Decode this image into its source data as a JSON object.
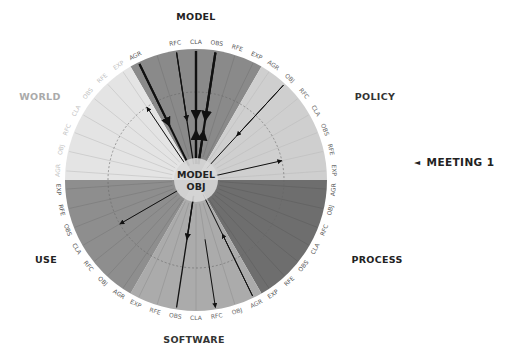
{
  "diagram": {
    "center": {
      "x": 196,
      "y": 180
    },
    "radius": 131,
    "hub": {
      "line1": "MODEL",
      "line2": "OBJ",
      "radius": 22,
      "color": "#d8d8d8"
    },
    "inner_ring_radius": 88,
    "tick_labels": [
      "AGR",
      "OBJ",
      "RFC",
      "CLA",
      "OBS",
      "RFE",
      "EXP"
    ],
    "sectors": [
      {
        "name": "MODEL",
        "start_deg": -30,
        "end_deg": 30,
        "fill": "#8a8a8a",
        "label_x": 196,
        "label_y": 20,
        "label_color": "#222222",
        "tick_color": "#555555",
        "omit_ticks": [
          "OBJ"
        ]
      },
      {
        "name": "POLICY",
        "start_deg": 30,
        "end_deg": 90,
        "fill": "#cfcfcf",
        "label_x": 375,
        "label_y": 100,
        "label_color": "#333333",
        "tick_color": "#666666",
        "omit_ticks": []
      },
      {
        "name": "PROCESS",
        "start_deg": 90,
        "end_deg": 150,
        "fill": "#6e6e6e",
        "label_x": 377,
        "label_y": 263,
        "label_color": "#222222",
        "tick_color": "#555555",
        "omit_ticks": []
      },
      {
        "name": "SOFTWARE",
        "start_deg": 150,
        "end_deg": 210,
        "fill": "#ababab",
        "label_x": 194,
        "label_y": 343,
        "label_color": "#333333",
        "tick_color": "#666666",
        "omit_ticks": []
      },
      {
        "name": "USE",
        "start_deg": 210,
        "end_deg": 270,
        "fill": "#8e8e8e",
        "label_x": 46,
        "label_y": 263,
        "label_color": "#222222",
        "tick_color": "#555555",
        "omit_ticks": []
      },
      {
        "name": "WORLD",
        "start_deg": 270,
        "end_deg": 330,
        "fill": "#e4e4e4",
        "label_x": 40,
        "label_y": 100,
        "label_color": "#aaaaaa",
        "tick_color": "#c2c2c2",
        "omit_ticks": []
      }
    ],
    "arrows": [
      {
        "from_sector": "MODEL",
        "tick": "AGR",
        "to": "center",
        "direction": "inward",
        "weight": 2.0
      },
      {
        "from_sector": "MODEL",
        "tick": "RFC",
        "to": "center",
        "direction": "inward",
        "weight": 1.2
      },
      {
        "from_sector": "MODEL",
        "tick": "CLA",
        "to": "center",
        "direction": "both",
        "weight": 2.2
      },
      {
        "from_sector": "MODEL",
        "tick": "OBS",
        "to": "center",
        "direction": "both",
        "weight": 2.2
      },
      {
        "from_sector": "POLICY",
        "tick": "OBJ",
        "to": "center",
        "direction": "inward",
        "weight": 1.0
      },
      {
        "from_sector": "POLICY",
        "tick": "RFE",
        "to": "center",
        "direction": "outward",
        "weight": 1.0,
        "partial": true
      },
      {
        "from_sector": "WORLD",
        "tick": "EXP",
        "to": "center",
        "direction": "outward",
        "weight": 1.0,
        "partial": true
      },
      {
        "from_sector": "USE",
        "tick": "CLA",
        "to": "center",
        "direction": "outward",
        "weight": 1.0,
        "partial": true
      },
      {
        "from_sector": "SOFTWARE",
        "tick": "OBS",
        "to": "center",
        "direction": "outward",
        "weight": 1.3
      },
      {
        "from_sector": "SOFTWARE",
        "tick": "RFC",
        "to": "center",
        "direction": "inward",
        "weight": 1.0,
        "partial": true
      },
      {
        "from_sector": "SOFTWARE",
        "tick": "AGR",
        "to": "center",
        "direction": "inward",
        "weight": 1.0
      }
    ]
  },
  "legend": {
    "marker": "◄",
    "label": "MEETING 1"
  }
}
